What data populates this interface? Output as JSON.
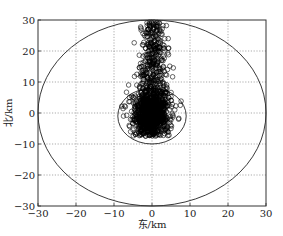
{
  "chart_data": {
    "type": "scatter",
    "title": "",
    "xlabel": "东/km",
    "ylabel": "北/km",
    "xlim": [
      -30,
      30
    ],
    "ylim": [
      -30,
      30
    ],
    "xticks": [
      -30,
      -20,
      -10,
      0,
      10,
      20,
      30
    ],
    "yticks": [
      -30,
      -20,
      -10,
      0,
      10,
      20,
      30
    ],
    "xtick_labels": [
      "−30",
      "−20",
      "−10",
      "0",
      "10",
      "20",
      "30"
    ],
    "ytick_labels": [
      "−30",
      "−20",
      "−10",
      "0",
      "10",
      "20",
      "30"
    ],
    "grid": true,
    "grid_style": "dotted",
    "legend": null,
    "marker": "open-circle",
    "marker_color": "#000000",
    "series": [
      {
        "name": "scatter points",
        "description": "Dense cloud of open circles, approx. 1500+ points, centered near (0,0), elongated northward up to y≈30, x mostly within −5..5 (wider at bottom, ~−8..7 near y=0), bottom extent ≈ −7",
        "approx_count": 1500,
        "distribution": {
          "core": {
            "x_mean": -0.3,
            "x_sd": 2.2,
            "y_mean": -1.5,
            "y_sd": 3.2,
            "weight": 0.62
          },
          "plume": {
            "x_mean": 0.3,
            "x_sd_at_base": 2.4,
            "x_sd_at_top": 1.4,
            "y_min": 2,
            "y_max": 30,
            "weight": 0.38
          }
        },
        "sample_points": [
          [
            0,
            29
          ],
          [
            1,
            28
          ],
          [
            -1,
            27
          ],
          [
            2,
            27
          ],
          [
            -2,
            25
          ],
          [
            1.5,
            24
          ],
          [
            -2.5,
            22
          ],
          [
            3,
            21
          ],
          [
            -1,
            20
          ],
          [
            0.5,
            18
          ],
          [
            -3,
            16
          ],
          [
            3,
            15
          ],
          [
            -2,
            12
          ],
          [
            2.5,
            11
          ],
          [
            -4,
            9
          ],
          [
            4,
            8
          ],
          [
            -5,
            5
          ],
          [
            5,
            4
          ],
          [
            -7,
            2
          ],
          [
            6,
            1
          ],
          [
            -7.5,
            -1
          ],
          [
            7,
            -2
          ],
          [
            -6,
            -4
          ],
          [
            5,
            -5
          ],
          [
            -3,
            -6
          ],
          [
            2,
            -7
          ],
          [
            0,
            0
          ],
          [
            -1,
            -2
          ],
          [
            1,
            3
          ],
          [
            0,
            -4
          ]
        ]
      }
    ],
    "shapes": [
      {
        "type": "circle",
        "name": "outer-range-circle",
        "center": [
          0,
          0
        ],
        "radius": 30,
        "color": "#222222"
      },
      {
        "type": "circle",
        "name": "inner-range-circle",
        "center": [
          0,
          -1
        ],
        "radius": 9,
        "color": "#222222"
      }
    ]
  },
  "layout": {
    "plot_area_px": {
      "left": 38,
      "top": 20,
      "right": 266,
      "bottom": 206
    }
  }
}
